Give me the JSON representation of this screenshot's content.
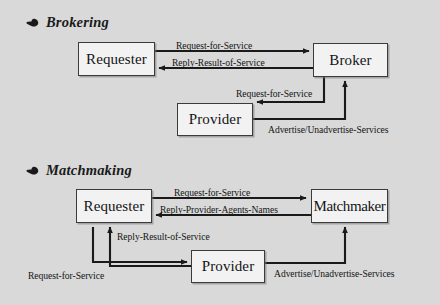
{
  "page": {
    "background_color": "#d9d9d9",
    "box_fill_color": "#f2f2f2",
    "line_color": "#1a1a1a"
  },
  "sections": [
    {
      "id": "brokering",
      "bullet_icon": "pointing-hand-bullet-icon",
      "title": "Brokering",
      "nodes": [
        {
          "id": "requester",
          "label": "Requester"
        },
        {
          "id": "broker",
          "label": "Broker"
        },
        {
          "id": "provider",
          "label": "Provider"
        }
      ],
      "edges": [
        {
          "id": "req-to-broker",
          "label": "Request-for-Service",
          "from": "requester",
          "to": "broker"
        },
        {
          "id": "broker-to-req",
          "label": "Reply-Result-of-Service",
          "from": "broker",
          "to": "requester"
        },
        {
          "id": "broker-to-provider",
          "label": "Request-for-Service",
          "from": "broker",
          "to": "provider"
        },
        {
          "id": "provider-to-broker",
          "label": "Advertise/Unadvertise-Services",
          "from": "provider",
          "to": "broker"
        }
      ]
    },
    {
      "id": "matchmaking",
      "bullet_icon": "pointing-hand-bullet-icon",
      "title": "Matchmaking",
      "nodes": [
        {
          "id": "requester",
          "label": "Requester"
        },
        {
          "id": "matchmaker",
          "label": "Matchmaker"
        },
        {
          "id": "provider",
          "label": "Provider"
        }
      ],
      "edges": [
        {
          "id": "req-to-matchmaker",
          "label": "Request-for-Service",
          "from": "requester",
          "to": "matchmaker"
        },
        {
          "id": "matchmaker-to-req",
          "label": "Reply-Provider-Agents-Names",
          "from": "matchmaker",
          "to": "requester"
        },
        {
          "id": "provider-to-req",
          "label": "Reply-Result-of-Service",
          "from": "provider",
          "to": "requester"
        },
        {
          "id": "req-to-provider",
          "label": "Request-for-Service",
          "from": "requester",
          "to": "provider"
        },
        {
          "id": "provider-to-matchmaker",
          "label": "Advertise/Unadvertise-Services",
          "from": "provider",
          "to": "matchmaker"
        }
      ]
    }
  ]
}
